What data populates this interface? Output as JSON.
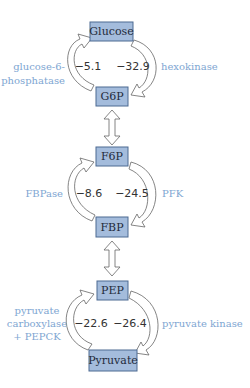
{
  "diagram": {
    "colors": {
      "node_fill": "#a4bcdc",
      "node_stroke": "#4d6a92",
      "enzyme_text": "#7ea6d2",
      "energy_text": "#333333"
    },
    "nodes": {
      "glucose": "Glucose",
      "g6p": "G6P",
      "f6p": "F6P",
      "fbp": "FBP",
      "pep": "PEP",
      "pyruvate": "Pyruvate"
    },
    "cycles": [
      {
        "top": "Glucose",
        "bottom": "G6P",
        "left_enzyme": [
          "glucose-6-",
          "phosphatase"
        ],
        "left_value": "−5.1",
        "right_value": "−32.9",
        "right_enzyme": [
          "hexokinase"
        ]
      },
      {
        "top": "F6P",
        "bottom": "FBP",
        "left_enzyme": [
          "FBPase"
        ],
        "left_value": "−8.6",
        "right_value": "−24.5",
        "right_enzyme": [
          "PFK"
        ]
      },
      {
        "top": "PEP",
        "bottom": "Pyruvate",
        "left_enzyme": [
          "pyruvate",
          "carboxylase",
          "+ PEPCK"
        ],
        "left_value": "−22.6",
        "right_value": "−26.4",
        "right_enzyme": [
          "pyruvate kinase"
        ]
      }
    ],
    "connectors": [
      {
        "from": "G6P",
        "to": "F6P",
        "type": "double-arrow"
      },
      {
        "from": "FBP",
        "to": "PEP",
        "type": "double-arrow"
      }
    ]
  }
}
